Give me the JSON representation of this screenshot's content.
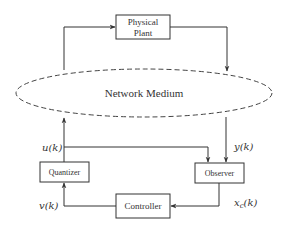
{
  "diagram": {
    "type": "block-diagram",
    "blocks": {
      "plant": {
        "line1": "Physical",
        "line2": "Plant"
      },
      "network": {
        "label": "Network Medium",
        "style": "dashed-ellipse"
      },
      "quantizer": {
        "label": "Quantizer"
      },
      "observer": {
        "label": "Observer"
      },
      "controller": {
        "label": "Controller"
      }
    },
    "signals": {
      "u": "u(k)",
      "y": "y(k)",
      "v": "v(k)",
      "xc_main": "x",
      "xc_sub": "c",
      "xc_arg": "(k)"
    },
    "edges": [
      {
        "from": "network",
        "to": "plant"
      },
      {
        "from": "plant",
        "to": "network"
      },
      {
        "from": "network",
        "to": "observer",
        "label": "y(k)"
      },
      {
        "from": "quantizer",
        "to": "network",
        "label": "u(k)"
      },
      {
        "from": "quantizer",
        "to": "observer",
        "label": "u(k)"
      },
      {
        "from": "observer",
        "to": "controller",
        "label": "x_c(k)"
      },
      {
        "from": "controller",
        "to": "quantizer",
        "label": "v(k)"
      }
    ],
    "colors": {
      "line": "#333333",
      "background": "#ffffff"
    }
  }
}
